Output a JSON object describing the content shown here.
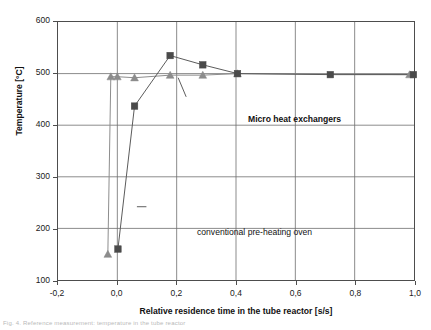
{
  "chart_data": {
    "type": "line",
    "title": "",
    "xlabel": "Relative residence time in the tube reactor [s/s]",
    "ylabel": "Temperature [°C]",
    "xlim": [
      -0.2,
      1.0
    ],
    "ylim": [
      100,
      600
    ],
    "xticks": [
      -0.2,
      0.0,
      0.2,
      0.4,
      0.6,
      0.8,
      1.0
    ],
    "xtick_labels": [
      "-0,2",
      "0,0",
      "0,2",
      "0,4",
      "0,6",
      "0,8",
      "1,0"
    ],
    "yticks": [
      100,
      200,
      300,
      400,
      500,
      600
    ],
    "ytick_labels": [
      "100",
      "200",
      "300",
      "400",
      "500",
      "600"
    ],
    "grid": true,
    "legend_position": "in-plot-annotations",
    "decimal_separator": ",",
    "series": [
      {
        "name": "Micro heat exchangers",
        "marker": "triangle",
        "color": "#8c8c8c",
        "line_color": "#8c8c8c",
        "points": [
          {
            "x": -0.032,
            "y": 150
          },
          {
            "x": -0.022,
            "y": 494
          },
          {
            "x": 0.0,
            "y": 494
          },
          {
            "x": 0.058,
            "y": 492
          },
          {
            "x": 0.178,
            "y": 497
          },
          {
            "x": 0.288,
            "y": 497
          },
          {
            "x": 0.405,
            "y": 500
          },
          {
            "x": 0.985,
            "y": 498
          }
        ]
      },
      {
        "name": "conventional pre-heating oven",
        "marker": "square",
        "color": "#4a4a4a",
        "line_color": "#5a5a5a",
        "points": [
          {
            "x": 0.002,
            "y": 160
          },
          {
            "x": 0.058,
            "y": 437
          },
          {
            "x": 0.178,
            "y": 535
          },
          {
            "x": 0.288,
            "y": 517
          },
          {
            "x": 0.405,
            "y": 500
          },
          {
            "x": 0.718,
            "y": 498
          },
          {
            "x": 0.998,
            "y": 498
          }
        ]
      }
    ],
    "annotations": [
      {
        "id": "micro-heat-exchangers",
        "text": "Micro heat exchangers",
        "bold": true,
        "leader_from": {
          "x": 0.232,
          "y": 455
        },
        "leader_to": {
          "x": 0.205,
          "y": 492
        }
      },
      {
        "id": "conventional-oven",
        "text": "conventional pre-heating oven",
        "bold": false,
        "leader_from": {
          "x": 0.066,
          "y": 242
        },
        "leader_to": {
          "x": 0.098,
          "y": 242
        }
      }
    ]
  },
  "axes": {
    "y_title": "Temperature [°C]",
    "x_title": "Relative residence time in the tube reactor [s/s]"
  },
  "caption": {
    "text": "Fig. 4. Reference measurement: temperature in the tube reactor"
  },
  "colors": {
    "frame": "#4d4d4d",
    "grid": "#6e6e6e",
    "series_micro": "#8c8c8c",
    "series_oven": "#4a4a4a",
    "background": "#ffffff",
    "text": "#1a1a1a"
  }
}
